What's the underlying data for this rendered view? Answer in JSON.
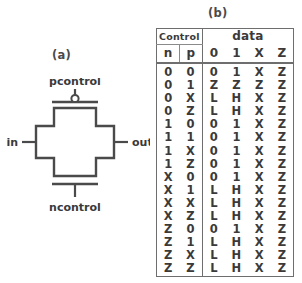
{
  "figures": {
    "a": {
      "label": "(a)",
      "caption": "(a)",
      "symbol": "cmos-transmission-gate",
      "pins": {
        "input": "in",
        "output": "out",
        "pmos_control": "pcontrol",
        "nmos_control": "ncontrol"
      },
      "stroke_color": "#4a4a4a",
      "fill_color": "#ffffff"
    },
    "b": {
      "label": "(b)",
      "caption": "(b)"
    }
  },
  "table": {
    "group_headers": {
      "control": "Control",
      "data": "data"
    },
    "columns": {
      "control": [
        "n",
        "p"
      ],
      "data": [
        "0",
        "1",
        "X",
        "Z"
      ]
    },
    "rows": [
      {
        "n": "0",
        "p": "0",
        "out": [
          "0",
          "1",
          "X",
          "Z"
        ]
      },
      {
        "n": "0",
        "p": "1",
        "out": [
          "Z",
          "Z",
          "Z",
          "Z"
        ]
      },
      {
        "n": "0",
        "p": "X",
        "out": [
          "L",
          "H",
          "X",
          "Z"
        ]
      },
      {
        "n": "0",
        "p": "Z",
        "out": [
          "L",
          "H",
          "X",
          "Z"
        ]
      },
      {
        "n": "1",
        "p": "0",
        "out": [
          "0",
          "1",
          "X",
          "Z"
        ]
      },
      {
        "n": "1",
        "p": "1",
        "out": [
          "0",
          "1",
          "X",
          "Z"
        ]
      },
      {
        "n": "1",
        "p": "X",
        "out": [
          "0",
          "1",
          "X",
          "Z"
        ]
      },
      {
        "n": "1",
        "p": "Z",
        "out": [
          "0",
          "1",
          "X",
          "Z"
        ]
      },
      {
        "n": "X",
        "p": "0",
        "out": [
          "0",
          "1",
          "X",
          "Z"
        ]
      },
      {
        "n": "X",
        "p": "1",
        "out": [
          "L",
          "H",
          "X",
          "Z"
        ]
      },
      {
        "n": "X",
        "p": "X",
        "out": [
          "L",
          "H",
          "X",
          "Z"
        ]
      },
      {
        "n": "X",
        "p": "Z",
        "out": [
          "L",
          "H",
          "X",
          "Z"
        ]
      },
      {
        "n": "Z",
        "p": "0",
        "out": [
          "0",
          "1",
          "X",
          "Z"
        ]
      },
      {
        "n": "Z",
        "p": "1",
        "out": [
          "L",
          "H",
          "X",
          "Z"
        ]
      },
      {
        "n": "Z",
        "p": "X",
        "out": [
          "L",
          "H",
          "X",
          "Z"
        ]
      },
      {
        "n": "Z",
        "p": "Z",
        "out": [
          "L",
          "H",
          "X",
          "Z"
        ]
      }
    ]
  },
  "colors": {
    "ink": "#3a3a3a",
    "line": "#6e6e6e",
    "background": "#ffffff"
  }
}
